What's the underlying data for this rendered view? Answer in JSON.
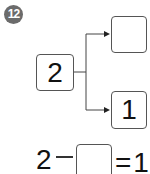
{
  "problem": {
    "number": "12",
    "source_value": "2",
    "top_value": "",
    "bottom_value": "1",
    "equation": {
      "left": "2",
      "operator": "−",
      "blank": "",
      "equals": "=",
      "result": "1"
    }
  }
}
